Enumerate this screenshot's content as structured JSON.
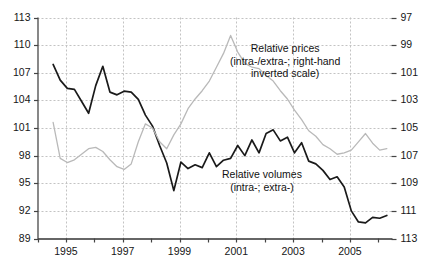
{
  "chart_data": {
    "type": "line",
    "title": "",
    "xlabel": "",
    "ylabel": "",
    "grid": true,
    "legend_position": "inline-annotations",
    "x_axis": {
      "tick_years": [
        1994,
        1995,
        1996,
        1997,
        1998,
        1999,
        2000,
        2001,
        2002,
        2003,
        2004,
        2005,
        2006
      ],
      "tick_labels": [
        "",
        "1995",
        "",
        "1997",
        "",
        "1999",
        "",
        "2001",
        "",
        "2003",
        "",
        "2005",
        ""
      ],
      "range": [
        1994,
        2006.5
      ]
    },
    "y_left": {
      "label": "Relative volumes",
      "ticks": [
        113,
        110,
        107,
        104,
        101,
        98,
        95,
        92,
        89
      ],
      "range": [
        89,
        113
      ],
      "inverted": false
    },
    "y_right": {
      "label": "Relative prices",
      "ticks": [
        97,
        99,
        101,
        103,
        105,
        107,
        109,
        111,
        113
      ],
      "range": [
        97,
        113
      ],
      "inverted": true
    },
    "annotations": [
      {
        "name": "relative-prices-annotation",
        "lines": [
          "Relative prices",
          "(intra-/extra-; right-hand",
          "inverted scale)"
        ]
      },
      {
        "name": "relative-volumes-annotation",
        "lines": [
          "Relative volumes",
          "(intra-; extra-)"
        ]
      }
    ],
    "series": [
      {
        "name": "Relative volumes (intra-; extra-)",
        "axis": "left",
        "color": "#1a1a1a",
        "width": 1.7,
        "x": [
          1994.55,
          1994.8,
          1995.05,
          1995.3,
          1995.55,
          1995.8,
          1996.05,
          1996.3,
          1996.55,
          1996.8,
          1997.05,
          1997.3,
          1997.55,
          1997.8,
          1998.05,
          1998.3,
          1998.55,
          1998.8,
          1999.05,
          1999.3,
          1999.55,
          1999.8,
          2000.05,
          2000.3,
          2000.55,
          2000.8,
          2001.05,
          2001.3,
          2001.55,
          2001.8,
          2002.05,
          2002.3,
          2002.55,
          2002.8,
          2003.05,
          2003.3,
          2003.55,
          2003.8,
          2004.05,
          2004.3,
          2004.55,
          2004.8,
          2005.05,
          2005.3,
          2005.55,
          2005.8,
          2006.05,
          2006.3
        ],
        "values": [
          107.9,
          106.2,
          105.3,
          105.2,
          103.9,
          102.6,
          105.6,
          107.7,
          104.9,
          104.6,
          105.0,
          104.9,
          104.1,
          102.4,
          101.2,
          99.1,
          97.2,
          94.2,
          97.3,
          96.6,
          97.0,
          96.7,
          98.3,
          96.8,
          97.5,
          97.7,
          99.1,
          98.0,
          99.7,
          98.3,
          100.4,
          100.8,
          99.6,
          100.0,
          98.3,
          99.4,
          97.4,
          97.1,
          96.4,
          95.4,
          95.7,
          94.6,
          92.0,
          90.8,
          90.7,
          91.3,
          91.2,
          91.5
        ]
      },
      {
        "name": "Relative prices (intra-/extra-; right-hand inverted scale)",
        "axis": "right",
        "color": "#b9b9b9",
        "width": 1.3,
        "x": [
          1994.55,
          1994.8,
          1995.05,
          1995.3,
          1995.55,
          1995.8,
          1996.05,
          1996.3,
          1996.55,
          1996.8,
          1997.05,
          1997.3,
          1997.55,
          1997.8,
          1998.05,
          1998.3,
          1998.55,
          1998.8,
          1999.05,
          1999.3,
          1999.55,
          1999.8,
          2000.05,
          2000.3,
          2000.55,
          2000.8,
          2001.05,
          2001.3,
          2001.55,
          2001.8,
          2002.05,
          2002.3,
          2002.55,
          2002.8,
          2003.05,
          2003.3,
          2003.55,
          2003.8,
          2004.05,
          2004.3,
          2004.55,
          2004.8,
          2005.05,
          2005.3,
          2005.55,
          2005.8,
          2006.05,
          2006.3
        ],
        "values": [
          104.6,
          107.2,
          107.5,
          107.3,
          106.9,
          106.5,
          106.4,
          106.7,
          107.3,
          107.8,
          108.0,
          107.6,
          106.0,
          104.7,
          105.0,
          106.0,
          106.5,
          105.5,
          104.7,
          103.6,
          102.9,
          102.3,
          101.6,
          100.6,
          99.6,
          98.3,
          99.5,
          100.3,
          100.6,
          100.7,
          101.2,
          101.6,
          102.3,
          102.9,
          103.7,
          104.4,
          105.2,
          105.6,
          106.2,
          106.5,
          106.9,
          106.8,
          106.6,
          106.0,
          105.4,
          106.1,
          106.6,
          106.5
        ]
      }
    ]
  }
}
